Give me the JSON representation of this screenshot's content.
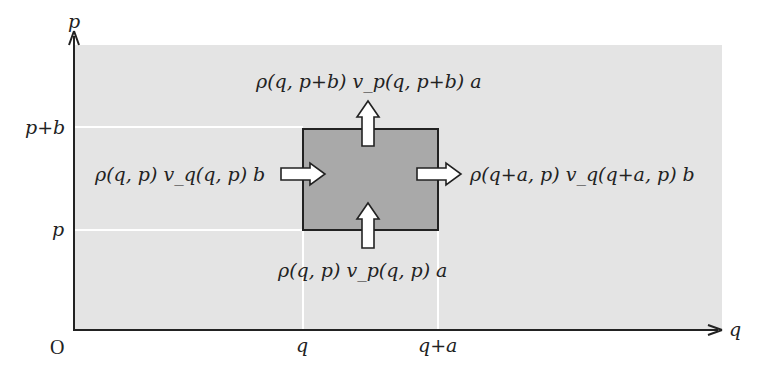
{
  "diagram": {
    "axes": {
      "origin_label": "O",
      "x_axis_label": "q",
      "y_axis_label": "p",
      "x_ticks": [
        "q",
        "q+a"
      ],
      "y_ticks": [
        "p+b",
        "p"
      ]
    },
    "flux_labels": {
      "top": "ρ(q, p+b) v_p(q, p+b) a",
      "left": "ρ(q, p) v_q(q, p) b",
      "right": "ρ(q+a, p) v_q(q+a, p) b",
      "bottom": "ρ(q, p) v_p(q, p) a"
    },
    "colors": {
      "background_region": "#e4e4e4",
      "cell_fill": "#a9a9a9",
      "cell_border": "#222222",
      "grid_lines": "#ffffff",
      "arrows_fill": "#ffffff",
      "axis": "#222222"
    }
  }
}
